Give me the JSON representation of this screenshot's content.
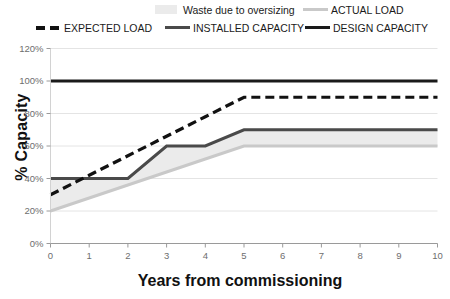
{
  "legend": {
    "row1": [
      {
        "label": "Waste due to oversizing",
        "marker": "area-swatch",
        "color": "#ebebeb"
      },
      {
        "label": "ACTUAL LOAD",
        "marker": "line-swatch",
        "color": "#c9c9c9"
      }
    ],
    "row2": [
      {
        "label": "EXPECTED LOAD",
        "marker": "dashed-line-swatch",
        "color": "#111111"
      },
      {
        "label": "INSTALLED CAPACITY",
        "marker": "line-swatch",
        "color": "#4a4a4a"
      },
      {
        "label": "DESIGN CAPACITY",
        "marker": "line-swatch",
        "color": "#1a1a1a"
      }
    ]
  },
  "axes": {
    "y_title": "% Capacity",
    "x_title": "Years from commissioning",
    "y_ticks": [
      "0%",
      "20%",
      "40%",
      "60%",
      "80%",
      "100%",
      "120%"
    ],
    "x_ticks": [
      "0",
      "1",
      "2",
      "3",
      "4",
      "5",
      "6",
      "7",
      "8",
      "9",
      "10"
    ]
  },
  "chart_data": {
    "type": "line",
    "title": "",
    "xlabel": "Years from commissioning",
    "ylabel": "% Capacity",
    "xlim": [
      0,
      10
    ],
    "ylim": [
      0,
      120
    ],
    "ytick_values": [
      0,
      20,
      40,
      60,
      80,
      100,
      120
    ],
    "xtick_values": [
      0,
      1,
      2,
      3,
      4,
      5,
      6,
      7,
      8,
      9,
      10
    ],
    "grid": "horizontal",
    "legend_position": "top",
    "x": [
      0,
      1,
      2,
      3,
      4,
      5,
      6,
      7,
      8,
      9,
      10
    ],
    "series": [
      {
        "name": "DESIGN CAPACITY",
        "style": "solid",
        "color": "#1a1a1a",
        "width": 3.2,
        "values": [
          100,
          100,
          100,
          100,
          100,
          100,
          100,
          100,
          100,
          100,
          100
        ]
      },
      {
        "name": "EXPECTED LOAD",
        "style": "dashed",
        "color": "#111111",
        "width": 3.2,
        "values": [
          30,
          42,
          54,
          66,
          78,
          90,
          90,
          90,
          90,
          90,
          90
        ]
      },
      {
        "name": "INSTALLED CAPACITY",
        "style": "solid",
        "color": "#4a4a4a",
        "width": 3.0,
        "values": [
          40,
          40,
          40,
          60,
          60,
          70,
          70,
          70,
          70,
          70,
          70
        ]
      },
      {
        "name": "ACTUAL LOAD",
        "style": "solid",
        "color": "#c9c9c9",
        "width": 3.0,
        "values": [
          20,
          28,
          36,
          44,
          52,
          60,
          60,
          60,
          60,
          60,
          60
        ]
      }
    ],
    "fill_between": {
      "name": "Waste due to oversizing",
      "color": "#ebebeb",
      "lower_series": "ACTUAL LOAD",
      "upper_series": "INSTALLED CAPACITY"
    }
  }
}
